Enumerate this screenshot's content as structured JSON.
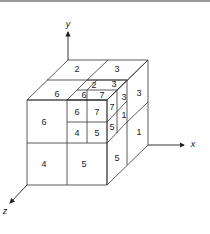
{
  "diagram": {
    "axes": {
      "x": "x",
      "y": "y",
      "z": "z"
    },
    "labels": {
      "top_back_left": "2",
      "top_back_right": "3",
      "top_front_left": "6",
      "right_back_top": "3",
      "right_back_bottom": "1",
      "front_top_left": "6",
      "front_bottom_left": "4",
      "front_bottom_right": "5",
      "right_front_bottom": "5",
      "sub_top_back_left": "2",
      "sub_top_back_right": "3",
      "sub_top_front_left": "6",
      "sub_top_front_right": "7",
      "sub_right_back_top": "3",
      "sub_right_back_bottom": "1",
      "sub_front_top_left": "6",
      "sub_front_top_right": "7",
      "sub_front_bottom_left": "4",
      "sub_front_bottom_right": "5",
      "sub_right_front_top": "7",
      "sub_right_front_bottom": "5"
    },
    "colors": {
      "line": "#333333",
      "background": "#ffffff"
    }
  }
}
